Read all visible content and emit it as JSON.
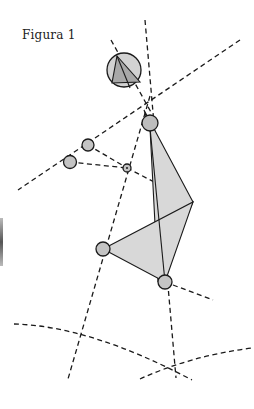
{
  "figure": {
    "caption": "Figura 1",
    "colors": {
      "stroke": "#1a1a1a",
      "fill_light": "#d6d6d6",
      "fill_joint": "#c4c4c4",
      "fill_dark": "#a8a8a8"
    },
    "joints": [
      "head",
      "shoulder",
      "upper-left-joint",
      "left-joint",
      "center-joint",
      "knee-joint",
      "foot-joint"
    ],
    "construction_lines": [
      "vertical-axis-left",
      "vertical-axis-right",
      "diagonal-upper",
      "diagonal-lower",
      "arc-lower-left",
      "arc-lower-right"
    ]
  }
}
